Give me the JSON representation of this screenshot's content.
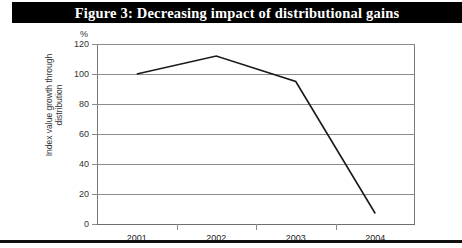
{
  "figure": {
    "title": "Figure 3: Decreasing impact of distributional gains"
  },
  "chart_data": {
    "type": "line",
    "title": "Figure 3: Decreasing impact of distributional gains",
    "categories": [
      "2001",
      "2002",
      "2003",
      "2004"
    ],
    "values": [
      100,
      112,
      95,
      7
    ],
    "series": [
      {
        "name": "Index value growth through distribution",
        "values": [
          100,
          112,
          95,
          7
        ]
      }
    ],
    "xlabel": "",
    "ylabel": "Index value growth through distribution",
    "unit_label": "%",
    "ylim": [
      0,
      120
    ],
    "yticks": [
      0,
      20,
      40,
      60,
      80,
      100,
      120
    ],
    "ytick_labels": [
      "0",
      "20",
      "40",
      "60",
      "80",
      "100",
      "120"
    ],
    "grid": true,
    "legend": false,
    "line_color": "#1a1a1a"
  },
  "axis": {
    "unit": "%",
    "y_title_line1": "Index value growth through",
    "y_title_line2": "distribution"
  }
}
